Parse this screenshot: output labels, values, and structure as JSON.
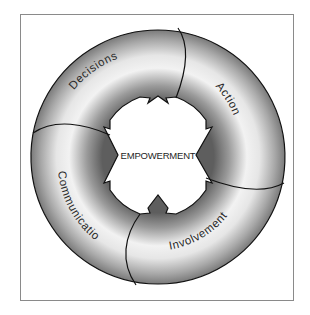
{
  "diagram": {
    "type": "cycle",
    "center_label": "EMPOWERMENT",
    "segments": [
      {
        "label": "Decisions",
        "position": "top-left"
      },
      {
        "label": "Action",
        "position": "top-right"
      },
      {
        "label": "Involvement",
        "position": "bottom-right"
      },
      {
        "label": "Communication",
        "position": "bottom-left"
      }
    ],
    "colors": {
      "ring_light": "#f4f4f4",
      "ring_dark": "#6f6f6f",
      "outline": "#111111",
      "frame": "#8a8a8a"
    }
  }
}
